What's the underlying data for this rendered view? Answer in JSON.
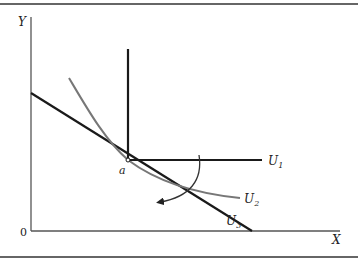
{
  "diagram": {
    "axes": {
      "y_label": "Y",
      "x_label": "X",
      "origin_label": "0"
    },
    "point_label": "a",
    "curves": [
      {
        "id": "U1",
        "label": "U",
        "subscript": "1",
        "type": "L-shaped (perfect complements)",
        "color": "#1a1a1a"
      },
      {
        "id": "U2",
        "label": "U",
        "subscript": "2",
        "type": "convex indifference curve",
        "color": "#777777"
      },
      {
        "id": "U3",
        "label": "U",
        "subscript": "3",
        "type": "straight line (perfect substitutes)",
        "color": "#1a1a1a"
      }
    ],
    "arrow": {
      "description": "curved arrow rotating clockwise from U1 toward U3",
      "color": "#333333"
    },
    "colors": {
      "border": "#555555",
      "axis": "#555555",
      "dark_line": "#1a1a1a",
      "gray_curve": "#777777",
      "background": "#ffffff"
    }
  }
}
